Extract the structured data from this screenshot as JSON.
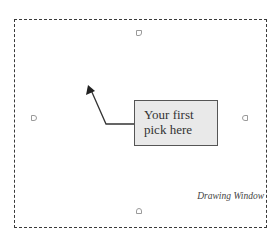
{
  "diagram": {
    "window_label": "Drawing Window",
    "callout": {
      "line1": "Your first",
      "line2": "pick here"
    },
    "arrow": {
      "tip": [
        89,
        86
      ],
      "elbow": [
        106,
        124
      ],
      "end": [
        134,
        124
      ]
    },
    "handles": [
      "top",
      "left",
      "right",
      "bottom"
    ],
    "colors": {
      "border": "#3a3a3a",
      "callout_fill": "#e9e9e9",
      "callout_border": "#555555",
      "text": "#333333",
      "handle": "#9a9a9a"
    }
  }
}
